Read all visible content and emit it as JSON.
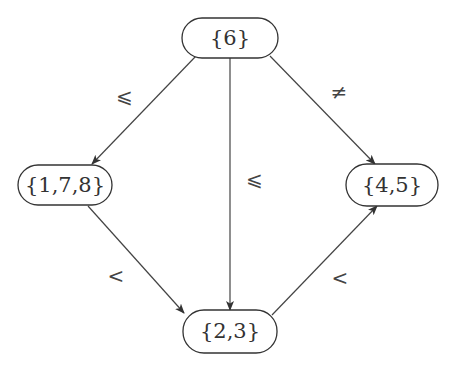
{
  "diagram": {
    "type": "directed-graph",
    "nodes": [
      {
        "id": "n6",
        "label": "{6}",
        "x": 230,
        "y": 38
      },
      {
        "id": "n178",
        "label": "{1,7,8}",
        "x": 62,
        "y": 185
      },
      {
        "id": "n45",
        "label": "{4,5}",
        "x": 392,
        "y": 185
      },
      {
        "id": "n23",
        "label": "{2,3}",
        "x": 230,
        "y": 330
      }
    ],
    "edges": [
      {
        "from": "{6}",
        "to": "{1,7,8}",
        "label": "⩽"
      },
      {
        "from": "{6}",
        "to": "{2,3}",
        "label": "⩽"
      },
      {
        "from": "{6}",
        "to": "{4,5}",
        "label": "≠"
      },
      {
        "from": "{1,7,8}",
        "to": "{2,3}",
        "label": "<"
      },
      {
        "from": "{2,3}",
        "to": "{4,5}",
        "label": "<"
      }
    ]
  }
}
